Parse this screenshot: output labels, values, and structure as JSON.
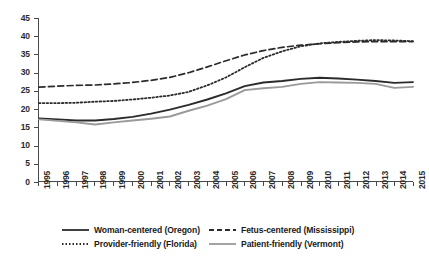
{
  "chart_data": {
    "type": "line",
    "title": "",
    "subtitle": "",
    "xlabel": "",
    "ylabel": "",
    "xlim": [
      1995,
      2015
    ],
    "ylim": [
      0,
      45
    ],
    "ytick_step": 5,
    "grid": false,
    "legend_position": "bottom",
    "x": [
      1995,
      1996,
      1997,
      1998,
      1999,
      2000,
      2001,
      2002,
      2003,
      2004,
      2005,
      2006,
      2007,
      2008,
      2009,
      2010,
      2011,
      2012,
      2013,
      2014,
      2015
    ],
    "categories": [
      "1995",
      "1996",
      "1997",
      "1998",
      "1999",
      "2000",
      "2001",
      "2002",
      "2003",
      "2004",
      "2005",
      "2006",
      "2007",
      "2008",
      "2009",
      "2010",
      "2011",
      "2012",
      "2013",
      "2014",
      "2015"
    ],
    "ytick_labels": [
      "0",
      "5",
      "10",
      "15",
      "20",
      "25",
      "30",
      "35",
      "40",
      "45"
    ],
    "ytick_values": [
      0,
      5,
      10,
      15,
      20,
      25,
      30,
      35,
      40,
      45
    ],
    "series": [
      {
        "name": "Woman-centered (Oregon)",
        "style": "solid",
        "color": "#2b2b2b",
        "width": 1.9,
        "values": [
          17.3,
          17.0,
          16.7,
          16.7,
          17.1,
          17.7,
          18.6,
          19.7,
          21.0,
          22.5,
          24.2,
          26.2,
          27.2,
          27.6,
          28.2,
          28.5,
          28.3,
          28.0,
          27.6,
          27.1,
          27.3
        ]
      },
      {
        "name": "Fetus-centered (Mississippi)",
        "style": "dashed",
        "color": "#2b2b2b",
        "width": 1.7,
        "values": [
          25.9,
          26.2,
          26.4,
          26.5,
          26.8,
          27.2,
          27.8,
          28.6,
          29.9,
          31.5,
          33.2,
          34.8,
          36.0,
          36.9,
          37.5,
          37.9,
          38.2,
          38.4,
          38.5,
          38.5,
          38.5
        ]
      },
      {
        "name": "Provider-friendly (Florida)",
        "style": "dotted",
        "color": "#2b2b2b",
        "width": 1.8,
        "values": [
          21.5,
          21.5,
          21.6,
          21.9,
          22.1,
          22.5,
          23.0,
          23.6,
          24.6,
          26.4,
          28.6,
          31.4,
          34.0,
          35.8,
          37.2,
          38.0,
          38.4,
          38.7,
          38.9,
          38.8,
          38.6
        ]
      },
      {
        "name": "Patient-friendly (Vermont)",
        "style": "solid",
        "color": "#9a9a9a",
        "width": 1.9,
        "values": [
          17.0,
          16.6,
          16.2,
          15.6,
          16.2,
          16.7,
          17.2,
          17.8,
          19.4,
          20.8,
          22.6,
          25.1,
          25.6,
          26.0,
          26.8,
          27.3,
          27.2,
          27.1,
          26.8,
          25.7,
          26.0
        ]
      }
    ]
  },
  "legend": {
    "items": [
      {
        "label": "Woman-centered (Oregon)",
        "style": "solid",
        "color": "#2b2b2b"
      },
      {
        "label": "Fetus-centered (Mississippi)",
        "style": "dashed",
        "color": "#2b2b2b"
      },
      {
        "label": "Provider-friendly (Florida)",
        "style": "dotted",
        "color": "#2b2b2b"
      },
      {
        "label": "Patient-friendly (Vermont)",
        "style": "solid",
        "color": "#9a9a9a"
      }
    ]
  }
}
